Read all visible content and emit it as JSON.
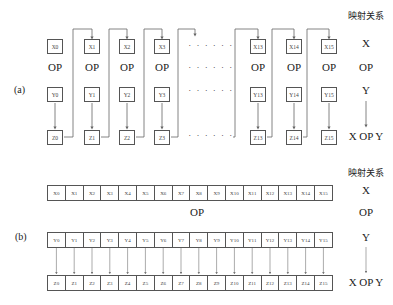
{
  "panel_a": {
    "tag": "(a)",
    "header": "映射关系",
    "columns": [
      {
        "x": "X0",
        "y": "Y0",
        "z": "Z0",
        "op": "OP"
      },
      {
        "x": "X1",
        "y": "Y1",
        "z": "Z1",
        "op": "OP"
      },
      {
        "x": "X2",
        "y": "Y2",
        "z": "Z2",
        "op": "OP"
      },
      {
        "x": "X3",
        "y": "Y3",
        "z": "Z3",
        "op": "OP"
      },
      {
        "x": "X13",
        "y": "Y13",
        "z": "Z13",
        "op": "OP"
      },
      {
        "x": "X14",
        "y": "Y14",
        "z": "Z14",
        "op": "OP"
      },
      {
        "x": "X15",
        "y": "Y15",
        "z": "Z15",
        "op": "OP"
      }
    ],
    "ellipsis": "· · · · · ·",
    "legend": {
      "x": "X",
      "op": "OP",
      "y": "Y",
      "result": "X OP Y"
    }
  },
  "panel_b": {
    "tag": "(b)",
    "header": "映射关系",
    "op_label": "OP",
    "x_row": [
      "X0",
      "X1",
      "X2",
      "X3",
      "X4",
      "X5",
      "X6",
      "X7",
      "X8",
      "X9",
      "X10",
      "X11",
      "X12",
      "X13",
      "X14",
      "X15"
    ],
    "y_row": [
      "Y0",
      "Y1",
      "Y2",
      "Y3",
      "Y4",
      "Y5",
      "Y6",
      "Y7",
      "Y8",
      "Y9",
      "Y10",
      "Y11",
      "Y12",
      "Y13",
      "Y14",
      "Y15"
    ],
    "z_row": [
      "Z0",
      "Z1",
      "Z2",
      "Z3",
      "Z4",
      "Z5",
      "Z6",
      "Z7",
      "Z8",
      "Z9",
      "Z10",
      "Z11",
      "Z12",
      "Z13",
      "Z14",
      "Z15"
    ],
    "legend": {
      "x": "X",
      "op": "OP",
      "y": "Y",
      "result": "X OP Y"
    }
  }
}
